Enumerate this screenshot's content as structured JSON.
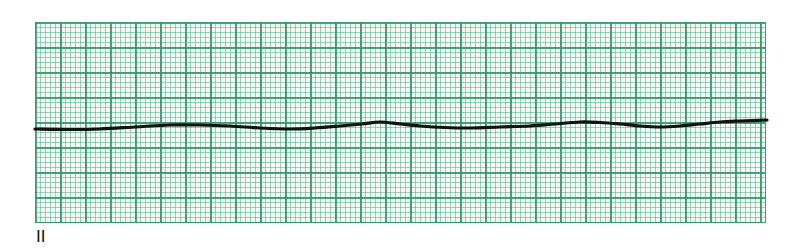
{
  "strip": {
    "lead_label": "II",
    "grid": {
      "major_box_px": 25,
      "minor_box_px": 5,
      "major_color": "#2e9669",
      "minor_color": "#50af82",
      "background": "#f4fbf7",
      "bounds": {
        "left": 35,
        "top": 22,
        "right": 766,
        "bottom": 223
      }
    },
    "trace": {
      "color": "#111111",
      "stroke_width": 3.2,
      "points": [
        [
          35,
          129
        ],
        [
          70,
          129.5
        ],
        [
          100,
          129
        ],
        [
          135,
          127
        ],
        [
          170,
          125
        ],
        [
          200,
          125
        ],
        [
          230,
          126
        ],
        [
          260,
          128
        ],
        [
          290,
          129
        ],
        [
          315,
          128
        ],
        [
          340,
          126
        ],
        [
          362,
          124
        ],
        [
          380,
          122
        ],
        [
          400,
          124
        ],
        [
          420,
          126
        ],
        [
          445,
          127.5
        ],
        [
          470,
          128
        ],
        [
          500,
          127
        ],
        [
          530,
          126
        ],
        [
          555,
          124
        ],
        [
          580,
          122
        ],
        [
          600,
          122.5
        ],
        [
          620,
          124
        ],
        [
          640,
          126
        ],
        [
          660,
          127
        ],
        [
          680,
          126
        ],
        [
          700,
          124
        ],
        [
          720,
          122
        ],
        [
          740,
          121
        ],
        [
          767,
          120
        ]
      ]
    }
  }
}
